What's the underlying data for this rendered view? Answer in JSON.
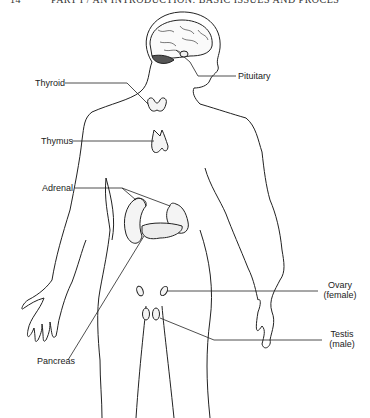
{
  "header": {
    "page_number": "14",
    "running_title": "PART I / AN INTRODUCTION: BASIC ISSUES AND PROCES"
  },
  "figure": {
    "labels": {
      "thyroid": "Thyroid",
      "pituitary": "Pituitary",
      "thymus": "Thymus",
      "adrenal": "Adrenal",
      "pancreas": "Pancreas",
      "ovary": "Ovary",
      "ovary_note": "(female)",
      "testis": "Testis",
      "testis_note": "(male)"
    },
    "colors": {
      "line": "#222222",
      "gland_fill": "#f4f4f4",
      "cerebellum": "#555555"
    }
  }
}
